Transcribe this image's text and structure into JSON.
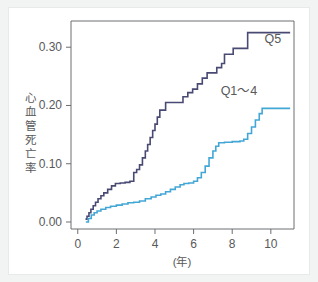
{
  "figure": {
    "background_color": "#f2f3f3",
    "panel_color": "#ffffff",
    "axis_color": "#6b6f72",
    "text_color": "#58595b"
  },
  "labels": {
    "q5": "Q5",
    "q14": "Q1〜4",
    "xaxis_unit": "(年)",
    "yaxis_title": "心血管死亡率",
    "yaxis_chars": [
      "心",
      "血",
      "管",
      "死",
      "亡",
      "率"
    ]
  },
  "chart_data": {
    "type": "line",
    "title": "",
    "xlabel": "(年)",
    "ylabel": "心血管死亡率",
    "xlim": [
      -0.35,
      11.2
    ],
    "ylim": [
      -0.012,
      0.345
    ],
    "xticks": [
      0,
      2,
      4,
      6,
      8,
      10
    ],
    "xtick_labels": [
      "0",
      "2",
      "4",
      "6",
      "8",
      "10"
    ],
    "yticks": [
      0.0,
      0.1,
      0.2,
      0.3
    ],
    "ytick_labels": [
      "0.00",
      "0.10",
      "0.20",
      "0.30"
    ],
    "grid": false,
    "legend_position": "inline-right",
    "step_style": "post",
    "series": [
      {
        "name": "Q5",
        "color": "#494a74",
        "label_x": 10.1,
        "label_y": 0.307,
        "final_value": 0.325,
        "x": [
          0.4,
          0.48,
          0.58,
          0.68,
          0.8,
          0.92,
          1.05,
          1.2,
          1.35,
          1.55,
          1.75,
          1.95,
          2.2,
          2.45,
          2.7,
          2.9,
          3.05,
          3.2,
          3.35,
          3.5,
          3.62,
          3.75,
          3.88,
          4.0,
          4.12,
          4.25,
          4.55,
          5.2,
          5.45,
          5.7,
          5.95,
          6.2,
          6.45,
          6.7,
          6.95,
          7.2,
          7.45,
          7.6,
          8.05,
          8.8,
          11.0
        ],
        "y": [
          0.005,
          0.01,
          0.016,
          0.022,
          0.028,
          0.034,
          0.04,
          0.045,
          0.05,
          0.056,
          0.062,
          0.066,
          0.067,
          0.068,
          0.07,
          0.085,
          0.09,
          0.098,
          0.11,
          0.122,
          0.133,
          0.145,
          0.157,
          0.168,
          0.18,
          0.192,
          0.205,
          0.205,
          0.215,
          0.222,
          0.228,
          0.237,
          0.247,
          0.256,
          0.256,
          0.265,
          0.272,
          0.288,
          0.298,
          0.325,
          0.325
        ]
      },
      {
        "name": "Q1〜4",
        "color": "#43a7d6",
        "label_x": 8.35,
        "label_y": 0.218,
        "final_value": 0.195,
        "x": [
          0.42,
          0.55,
          0.7,
          0.85,
          1.0,
          1.2,
          1.45,
          1.7,
          2.0,
          2.3,
          2.6,
          2.9,
          3.2,
          3.5,
          3.8,
          4.05,
          4.3,
          4.55,
          4.8,
          5.05,
          5.3,
          5.5,
          5.75,
          6.0,
          6.2,
          6.4,
          6.6,
          6.8,
          7.0,
          7.15,
          7.3,
          7.6,
          8.0,
          8.4,
          8.6,
          8.8,
          9.0,
          9.2,
          9.4,
          9.55,
          11.0
        ],
        "y": [
          0.0,
          0.006,
          0.012,
          0.016,
          0.019,
          0.022,
          0.025,
          0.027,
          0.029,
          0.031,
          0.033,
          0.034,
          0.036,
          0.04,
          0.043,
          0.046,
          0.048,
          0.052,
          0.056,
          0.06,
          0.064,
          0.066,
          0.067,
          0.07,
          0.076,
          0.085,
          0.096,
          0.11,
          0.122,
          0.13,
          0.136,
          0.137,
          0.138,
          0.139,
          0.142,
          0.152,
          0.163,
          0.175,
          0.186,
          0.195,
          0.195
        ]
      }
    ]
  }
}
